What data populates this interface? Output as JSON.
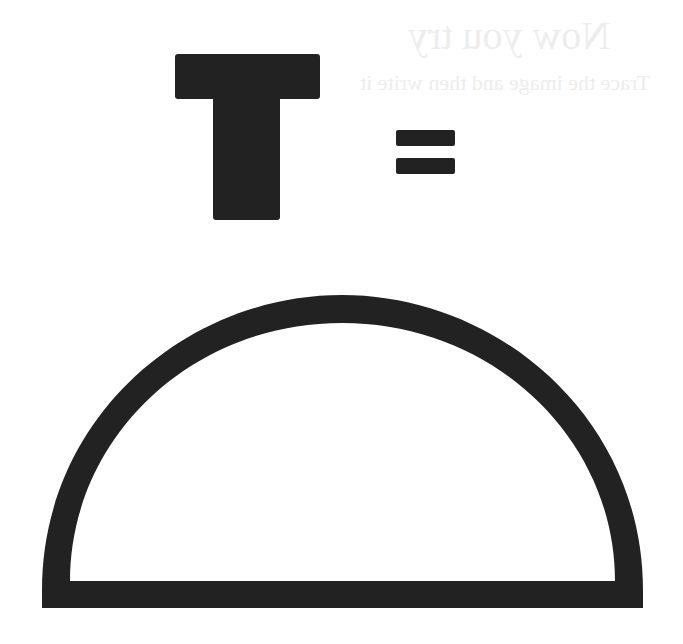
{
  "background_showthrough": {
    "title": "Now you try",
    "subtitle": "Trace the image and then write it"
  },
  "symbols": {
    "letter": "T",
    "operator": "=",
    "shape": "semicircle-outline"
  },
  "colors": {
    "ink": "#222222",
    "background": "#ffffff"
  }
}
